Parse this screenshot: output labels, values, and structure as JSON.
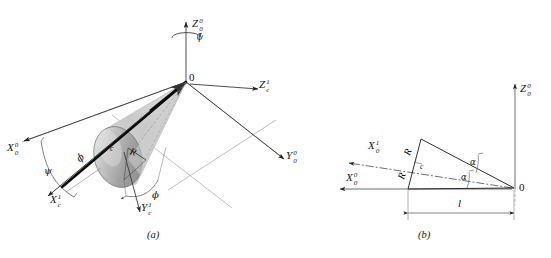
{
  "figure": {
    "caption_a": "(a)",
    "caption_b": "(b)"
  },
  "panel_a": {
    "origin_label": "0",
    "center_label": "c",
    "axes": [
      {
        "name": "Z0-0-axis",
        "base": "Z",
        "sup": "0",
        "sub": "0"
      },
      {
        "name": "X0-0-axis",
        "base": "X",
        "sup": "0",
        "sub": "0"
      },
      {
        "name": "Y0-0-axis",
        "base": "Y",
        "sup": "0",
        "sub": "0"
      },
      {
        "name": "Zc-1-axis",
        "base": "Z",
        "sup": "1",
        "sub": "c"
      },
      {
        "name": "Xc-1-axis",
        "base": "X",
        "sup": "1",
        "sub": "c"
      },
      {
        "name": "Yc-1-axis",
        "base": "Y",
        "sup": "1",
        "sub": "c"
      }
    ],
    "angles": {
      "psi": "ψ",
      "psi_dot": "ψ̇",
      "phi": "ϕ",
      "phi_dot": "ϕ̇"
    },
    "radius_label": "R"
  },
  "panel_b": {
    "origin_label": "0",
    "center_label": "c",
    "axes": [
      {
        "name": "Z0-0-axis",
        "base": "Z",
        "sup": "0",
        "sub": "0"
      },
      {
        "name": "X0-1-axis",
        "base": "X",
        "sup": "1",
        "sub": "0"
      },
      {
        "name": "X0-0-axis",
        "base": "X",
        "sup": "0",
        "sub": "0"
      }
    ],
    "radius_label_upper": "R",
    "radius_label_lower": "R",
    "alpha_upper": "α",
    "alpha_lower": "α",
    "length_label": "l"
  },
  "colors": {
    "line": "#3a3a3a",
    "heavy": "#000000",
    "cone_light": "#d9d9d9",
    "cone_mid": "#a8a8a8",
    "cone_dark": "#7d7d7d",
    "background": "#ffffff"
  }
}
